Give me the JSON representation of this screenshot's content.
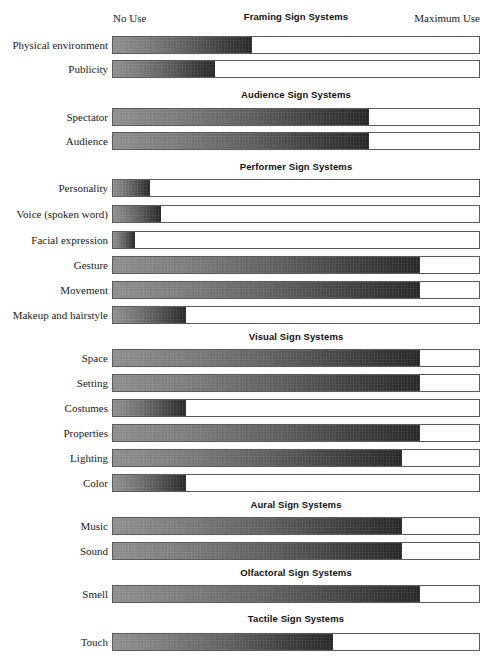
{
  "axis": {
    "left_label": "No Use",
    "right_label": "Maximum Use"
  },
  "sections": [
    {
      "title": "Framing Sign Systems",
      "title_top": 11,
      "rows": [
        {
          "label": "Physical environment",
          "value": 38,
          "top": 36
        },
        {
          "label": "Publicity",
          "value": 28,
          "top": 60
        }
      ]
    },
    {
      "title": "Audience Sign Systems",
      "title_top": 89,
      "rows": [
        {
          "label": "Spectator",
          "value": 70,
          "top": 108
        },
        {
          "label": "Audience",
          "value": 70,
          "top": 132
        }
      ]
    },
    {
      "title": "Performer Sign Systems",
      "title_top": 161,
      "rows": [
        {
          "label": "Personality",
          "value": 10,
          "top": 179
        },
        {
          "label": "Voice (spoken word)",
          "value": 13,
          "top": 205
        },
        {
          "label": "Facial expression",
          "value": 6,
          "top": 231
        },
        {
          "label": "Gesture",
          "value": 84,
          "top": 256
        },
        {
          "label": "Movement",
          "value": 84,
          "top": 281
        },
        {
          "label": "Makeup and hairstyle",
          "value": 20,
          "top": 306
        }
      ]
    },
    {
      "title": "Visual Sign Systems",
      "title_top": 331,
      "rows": [
        {
          "label": "Space",
          "value": 84,
          "top": 349
        },
        {
          "label": "Setting",
          "value": 84,
          "top": 374
        },
        {
          "label": "Costumes",
          "value": 20,
          "top": 399
        },
        {
          "label": "Properties",
          "value": 84,
          "top": 424
        },
        {
          "label": "Lighting",
          "value": 79,
          "top": 449
        },
        {
          "label": "Color",
          "value": 20,
          "top": 474
        }
      ]
    },
    {
      "title": "Aural Sign Systems",
      "title_top": 499,
      "rows": [
        {
          "label": "Music",
          "value": 79,
          "top": 517
        },
        {
          "label": "Sound",
          "value": 79,
          "top": 542
        }
      ]
    },
    {
      "title": "Olfactoral Sign Systems",
      "title_top": 567,
      "rows": [
        {
          "label": "Smell",
          "value": 84,
          "top": 585
        }
      ]
    },
    {
      "title": "Tactile Sign Systems",
      "title_top": 613,
      "rows": [
        {
          "label": "Touch",
          "value": 60,
          "top": 633
        }
      ]
    }
  ],
  "chart_data": {
    "type": "bar",
    "title": "",
    "orientation": "horizontal",
    "xlabel": "",
    "ylabel": "",
    "xlim": [
      0,
      100
    ],
    "grid": false,
    "legend": false,
    "axis_tick_labels": [
      "No Use",
      "Maximum Use"
    ],
    "groups": [
      {
        "name": "Framing Sign Systems",
        "categories": [
          "Physical environment",
          "Publicity"
        ],
        "values": [
          38,
          28
        ]
      },
      {
        "name": "Audience Sign Systems",
        "categories": [
          "Spectator",
          "Audience"
        ],
        "values": [
          70,
          70
        ]
      },
      {
        "name": "Performer Sign Systems",
        "categories": [
          "Personality",
          "Voice (spoken word)",
          "Facial expression",
          "Gesture",
          "Movement",
          "Makeup and hairstyle"
        ],
        "values": [
          10,
          13,
          6,
          84,
          84,
          20
        ]
      },
      {
        "name": "Visual Sign Systems",
        "categories": [
          "Space",
          "Setting",
          "Costumes",
          "Properties",
          "Lighting",
          "Color"
        ],
        "values": [
          84,
          84,
          20,
          84,
          79,
          20
        ]
      },
      {
        "name": "Aural Sign Systems",
        "categories": [
          "Music",
          "Sound"
        ],
        "values": [
          79,
          79
        ]
      },
      {
        "name": "Olfactoral Sign Systems",
        "categories": [
          "Smell"
        ],
        "values": [
          84
        ]
      },
      {
        "name": "Tactile Sign Systems",
        "categories": [
          "Touch"
        ],
        "values": [
          60
        ]
      }
    ],
    "colors": {
      "fill_start": "#8d8d8d",
      "fill_end": "#272727",
      "track_border": "#5a5a5a",
      "track_background": "#ffffff",
      "text": "#1a1a1a"
    }
  }
}
